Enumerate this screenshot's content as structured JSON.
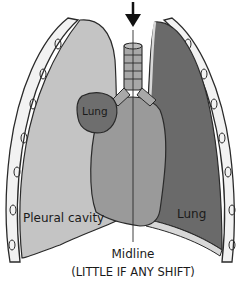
{
  "diagram": {
    "labels": {
      "left_lung": "Lung",
      "pleural_cavity": "Pleural cavity",
      "right_lung": "Lung",
      "midline": "Midline",
      "shift_note": "(LITTLE IF ANY SHIFT)"
    },
    "colors": {
      "pleural_cavity": "#c4c4c4",
      "collapsed_lung": "#6e6e6e",
      "heart": "#9a9a9a",
      "right_lung": "#6a6a6a",
      "ribs": "#f2f2f2",
      "trachea": "#a8a8a8",
      "outline": "#2a2a2a"
    }
  }
}
